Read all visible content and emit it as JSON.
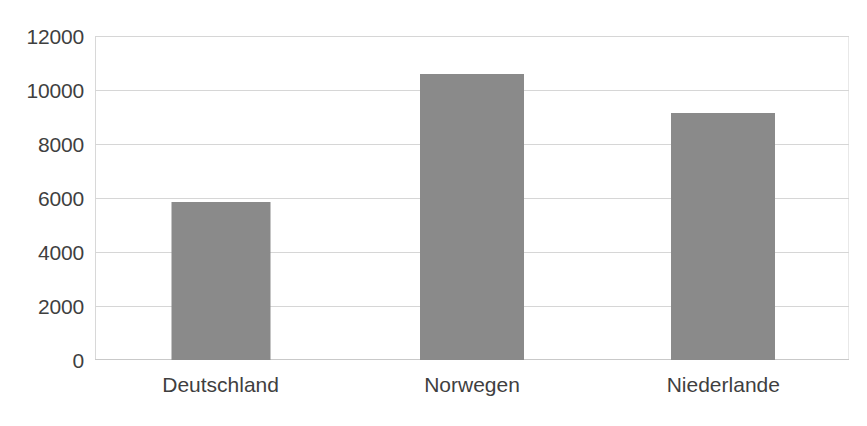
{
  "chart_data": {
    "type": "bar",
    "title": "",
    "subtitle": "",
    "xlabel": "",
    "ylabel": "",
    "categories": [
      "Deutschland",
      "Norwegen",
      "Niederlande"
    ],
    "values": [
      5870,
      10590,
      9150
    ],
    "ylim": [
      0,
      12000
    ],
    "ytick_labels": [
      "12000",
      "10000",
      "8000",
      "6000",
      "4000",
      "2000",
      "0"
    ],
    "ytick_values": [
      12000,
      10000,
      8000,
      6000,
      4000,
      2000,
      0
    ],
    "ytick_step": 2000,
    "grid": true,
    "grid_axis": "y",
    "legend": false,
    "legend_position": "none",
    "annotations": [],
    "data_labels": false,
    "bar_color": "#8a8a8a",
    "gridline_color": "#d6d6d6",
    "axis_text_color": "#3f3f3f",
    "background_color": "#ffffff"
  }
}
